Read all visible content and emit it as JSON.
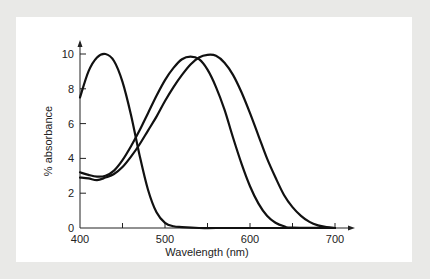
{
  "chart_data": {
    "type": "line",
    "title": "",
    "xlabel": "Wavelength (nm)",
    "ylabel": "% absorbance",
    "xlim": [
      400,
      700
    ],
    "ylim": [
      0,
      10
    ],
    "x_ticks": [
      400,
      500,
      600,
      700
    ],
    "x_minor_ticks": [
      450,
      550,
      650
    ],
    "y_ticks": [
      0,
      2,
      4,
      6,
      8,
      10
    ],
    "grid": false,
    "legend": null,
    "series": [
      {
        "name": "short-wavelength curve",
        "x": [
          400,
          410,
          420,
          430,
          440,
          450,
          460,
          470,
          480,
          490,
          500,
          510,
          520,
          540,
          560,
          600,
          700
        ],
        "y": [
          7.5,
          9.0,
          9.8,
          10.0,
          9.6,
          8.4,
          6.5,
          4.2,
          2.2,
          0.9,
          0.3,
          0.1,
          0.05,
          0.0,
          0.0,
          0.0,
          0.0
        ]
      },
      {
        "name": "medium-wavelength curve",
        "x": [
          400,
          410,
          420,
          430,
          440,
          450,
          460,
          470,
          480,
          490,
          500,
          510,
          520,
          530,
          540,
          550,
          560,
          570,
          580,
          590,
          600,
          610,
          620,
          630,
          640,
          650,
          700
        ],
        "y": [
          3.2,
          3.05,
          2.95,
          3.0,
          3.3,
          3.9,
          4.7,
          5.6,
          6.6,
          7.6,
          8.5,
          9.2,
          9.7,
          9.85,
          9.7,
          9.1,
          8.1,
          6.8,
          5.2,
          3.7,
          2.4,
          1.4,
          0.7,
          0.3,
          0.1,
          0.02,
          0.0
        ]
      },
      {
        "name": "long-wavelength curve",
        "x": [
          400,
          410,
          420,
          430,
          440,
          450,
          460,
          470,
          480,
          490,
          500,
          510,
          520,
          530,
          540,
          550,
          560,
          570,
          580,
          590,
          600,
          610,
          620,
          630,
          640,
          650,
          660,
          670,
          680,
          690,
          700
        ],
        "y": [
          2.9,
          2.85,
          2.75,
          2.9,
          3.1,
          3.5,
          4.1,
          4.8,
          5.6,
          6.4,
          7.3,
          8.1,
          8.8,
          9.4,
          9.8,
          9.95,
          9.9,
          9.5,
          8.8,
          7.8,
          6.6,
          5.3,
          4.0,
          2.9,
          1.9,
          1.2,
          0.7,
          0.35,
          0.15,
          0.05,
          0.0
        ]
      }
    ]
  }
}
